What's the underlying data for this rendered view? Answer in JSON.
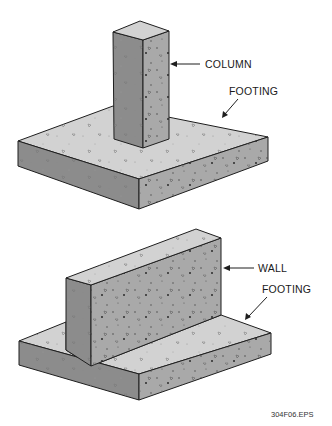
{
  "figure": {
    "top_diagram": {
      "labels": {
        "column": "COLUMN",
        "footing": "FOOTING"
      }
    },
    "bottom_diagram": {
      "labels": {
        "wall": "WALL",
        "footing": "FOOTING"
      }
    },
    "file_reference": "304F06.EPS"
  },
  "colors": {
    "top_face": "#d2d2d2",
    "light_side": "#a9a9a9",
    "dark_side": "#8c8c8c",
    "outline": "#1e1e1e",
    "aggregate": "#2a2a2a"
  }
}
